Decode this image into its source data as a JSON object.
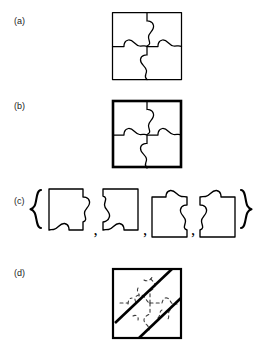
{
  "figure": {
    "background_color": "#ffffff",
    "stroke_color": "#000000",
    "faded_stroke_color": "#3d3d3d",
    "panels": [
      {
        "id": "a",
        "label": "(a)",
        "caption_x": 14,
        "caption_y": 16,
        "content": "assembled-jigsaw-square-thin-border",
        "square": {
          "x": 112,
          "y": 12,
          "width": 70,
          "height": 68
        },
        "border_width": 1.3,
        "pieces": 4
      },
      {
        "id": "b",
        "label": "(b)",
        "caption_x": 14,
        "caption_y": 101,
        "content": "assembled-jigsaw-square-thick-border",
        "square": {
          "x": 112,
          "y": 100,
          "width": 70,
          "height": 68
        },
        "border_width": 2.6,
        "pieces": 4
      },
      {
        "id": "c",
        "label": "(c)",
        "caption_x": 14,
        "caption_y": 196,
        "content": "set-of-four-separated-pieces-in-braces",
        "open_brace": "{",
        "close_brace": "}",
        "separators": [
          ",",
          ",",
          ","
        ],
        "piece_count": 4,
        "piece_descriptions": [
          "tab-right-tab-bottom",
          "socket-left-tab-bottom",
          "tab-top-socket-right",
          "tab-top-socket-left"
        ]
      },
      {
        "id": "d",
        "label": "(d)",
        "caption_x": 14,
        "caption_y": 268,
        "content": "crossed-out-scrambled-puzzle-square",
        "square": {
          "x": 112,
          "y": 268,
          "width": 70,
          "height": 70
        },
        "border_width": 2.2,
        "cross_out_lines": 2,
        "cross_out_width": 2.6,
        "interior_style": "dashed-faint-puzzle-curves"
      }
    ]
  }
}
